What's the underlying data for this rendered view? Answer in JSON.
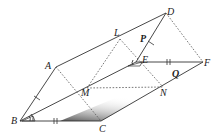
{
  "diagram": {
    "type": "geometry-figure",
    "points": [
      {
        "id": "A",
        "label": "A"
      },
      {
        "id": "B",
        "label": "B"
      },
      {
        "id": "C",
        "label": "C"
      },
      {
        "id": "D",
        "label": "D"
      },
      {
        "id": "E",
        "label": "E"
      },
      {
        "id": "F",
        "label": "F"
      },
      {
        "id": "L",
        "label": "L"
      },
      {
        "id": "M",
        "label": "M"
      },
      {
        "id": "N",
        "label": "N"
      },
      {
        "id": "P",
        "label": "P"
      },
      {
        "id": "Q",
        "label": "Q"
      }
    ],
    "solid_edges": [
      [
        "A",
        "D"
      ],
      [
        "A",
        "B"
      ],
      [
        "B",
        "C"
      ],
      [
        "B",
        "E"
      ],
      [
        "C",
        "F"
      ],
      [
        "D",
        "E"
      ],
      [
        "E",
        "F"
      ]
    ],
    "dashed_edges": [
      [
        "A",
        "C"
      ],
      [
        "L",
        "N"
      ],
      [
        "M",
        "N"
      ],
      [
        "D",
        "F"
      ],
      [
        "L",
        "M"
      ]
    ],
    "markings": {
      "single_tick": [
        "AB",
        "DE"
      ],
      "double_tick": [
        "BC",
        "EF"
      ],
      "angle_marks": [
        "B",
        "E"
      ]
    },
    "shaded_region": "near C, between B-C and C-N"
  }
}
